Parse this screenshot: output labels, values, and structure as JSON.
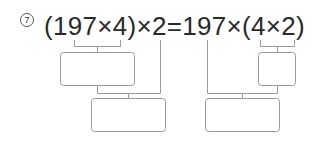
{
  "problem": {
    "number_label": "7",
    "expression": "(197×4)×2=197×(4×2)",
    "answer_boxes": [
      {
        "id": "left-inner",
        "value": ""
      },
      {
        "id": "left-outer",
        "value": ""
      },
      {
        "id": "right-inner",
        "value": ""
      },
      {
        "id": "right-outer",
        "value": ""
      }
    ]
  }
}
